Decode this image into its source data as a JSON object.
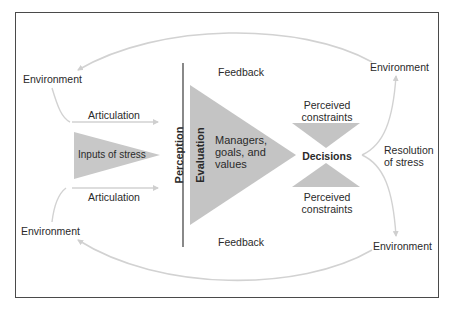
{
  "diagram": {
    "labels": {
      "env_top_left": "Environment",
      "env_top_right": "Environment",
      "env_bottom_left": "Environment",
      "env_bottom_right": "Environment",
      "articulation_top": "Articulation",
      "articulation_bottom": "Articulation",
      "inputs_of_stress": "Inputs of stress",
      "perception": "Perception",
      "evaluation": "Evaluation",
      "managers_line1": "Managers,",
      "managers_line2": "goals, and",
      "managers_line3": "values",
      "feedback_top": "Feedback",
      "feedback_bottom": "Feedback",
      "perceived_top_line1": "Perceived",
      "perceived_top_line2": "constraints",
      "perceived_bottom_line1": "Perceived",
      "perceived_bottom_line2": "constraints",
      "decisions": "Decisions",
      "resolution_line1": "Resolution",
      "resolution_line2": "of stress"
    },
    "colors": {
      "shape_fill": "#c4c4c4",
      "arrow": "#cfcfcf",
      "frame": "#4a4a4a",
      "divider": "#3a3a3a",
      "text": "#2a2a2a"
    }
  }
}
